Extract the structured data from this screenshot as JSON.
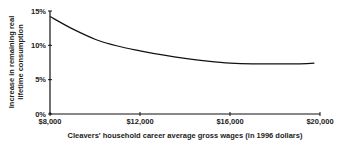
{
  "chart_data": {
    "type": "line",
    "title": "",
    "xlabel": "Cleavers' household career average gross wages (in 1996 dollars)",
    "ylabel": "Increase in remaining real lifetime consumption",
    "ylabel_lines": [
      "Increase in remaining real",
      "lifetime consumption"
    ],
    "xlim": [
      8000,
      20000
    ],
    "ylim": [
      0,
      15
    ],
    "x_ticks": [
      8000,
      12000,
      16000,
      20000
    ],
    "x_tick_labels": [
      "$8,000",
      "$12,000",
      "$16,000",
      "$20,000"
    ],
    "y_ticks": [
      0,
      5,
      10,
      15
    ],
    "y_tick_labels": [
      "0%",
      "5%",
      "10%",
      "15%"
    ],
    "grid": false,
    "legend": null,
    "series": [
      {
        "name": "Increase in remaining real lifetime consumption",
        "x": [
          8000,
          9000,
          10000,
          11000,
          12000,
          13000,
          14000,
          15000,
          16000,
          17000,
          18000,
          19000,
          19750
        ],
        "y": [
          14.2,
          12.4,
          10.9,
          9.9,
          9.2,
          8.6,
          8.1,
          7.7,
          7.4,
          7.3,
          7.3,
          7.3,
          7.4
        ]
      }
    ]
  }
}
